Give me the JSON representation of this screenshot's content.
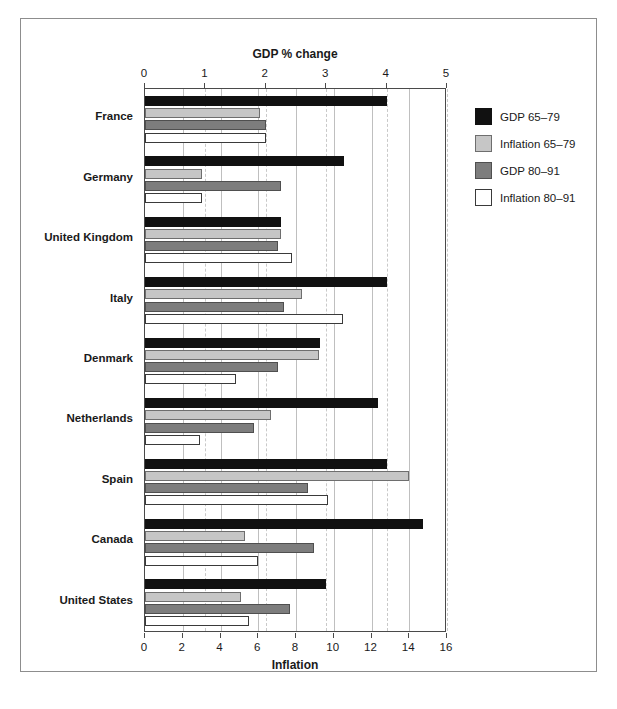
{
  "chart": {
    "top_axis_title": "GDP % change",
    "bottom_axis_title": "Inflation"
  },
  "chart_data": {
    "type": "bar",
    "orientation": "horizontal",
    "title": "",
    "subtitle": "",
    "xlabel": "Inflation",
    "x2label": "GDP % change",
    "ylabel": "",
    "grid": true,
    "legend_position": "right",
    "categories": [
      "France",
      "Germany",
      "United Kingdom",
      "Italy",
      "Denmark",
      "Netherlands",
      "Spain",
      "Canada",
      "United States"
    ],
    "bottom_axis": {
      "label": "Inflation",
      "lim": [
        0,
        16
      ],
      "ticks": [
        0,
        2,
        4,
        6,
        8,
        10,
        12,
        14,
        16
      ],
      "tick_labels": [
        "0",
        "2",
        "4",
        "6",
        "8",
        "10",
        "12",
        "14",
        "16"
      ]
    },
    "top_axis": {
      "label": "GDP % change",
      "lim": [
        0,
        5
      ],
      "ticks": [
        0,
        1,
        2,
        3,
        4,
        5
      ],
      "tick_labels": [
        "0",
        "1",
        "2",
        "3",
        "4",
        "5"
      ]
    },
    "series": [
      {
        "name": "GDP 65–79",
        "axis": "top",
        "color": "#111111",
        "values": [
          4.0,
          3.3,
          2.25,
          4.0,
          2.9,
          3.85,
          4.0,
          4.6,
          3.0
        ]
      },
      {
        "name": "Inflation 65–79",
        "axis": "bottom",
        "color": "#c6c6c6",
        "values": [
          6.1,
          3.0,
          7.2,
          8.3,
          9.2,
          6.7,
          14.0,
          5.3,
          5.1
        ]
      },
      {
        "name": "GDP 80–91",
        "axis": "top",
        "color": "#7d7d7d",
        "values": [
          2.0,
          2.25,
          2.2,
          2.3,
          2.2,
          1.8,
          2.7,
          2.8,
          2.4
        ]
      },
      {
        "name": "Inflation 80–91",
        "axis": "bottom",
        "color": "#ffffff",
        "values": [
          6.4,
          3.0,
          7.8,
          10.5,
          4.8,
          2.9,
          9.7,
          6.0,
          5.5
        ]
      }
    ]
  },
  "legend": {
    "items": [
      {
        "label": "GDP 65–79",
        "swatch": "black-swatch"
      },
      {
        "label": "Inflation 65–79",
        "swatch": "light-gray-swatch"
      },
      {
        "label": "GDP 80–91",
        "swatch": "dark-gray-swatch"
      },
      {
        "label": "Inflation 80–91",
        "swatch": "white-swatch"
      }
    ]
  }
}
